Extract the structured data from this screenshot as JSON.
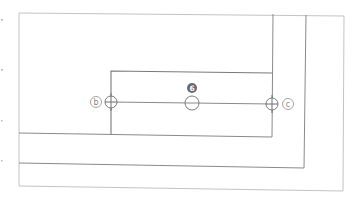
{
  "diagram": {
    "type": "line-drawing",
    "colors": {
      "line": "#8a8a8a",
      "line_light": "#c4c4c4",
      "marker_fill": "#6a6a6a",
      "background": "#ffffff"
    },
    "grid_labels": [
      {
        "id": "b",
        "text": "b",
        "x": 96,
        "y": 103
      },
      {
        "id": "c",
        "text": "c",
        "x": 288,
        "y": 103
      }
    ],
    "numbered_marker": {
      "text": "6",
      "x": 192,
      "y": 88
    },
    "crosshair_markers": [
      {
        "name": "left",
        "x": 111,
        "y": 103
      },
      {
        "name": "center",
        "x": 192,
        "y": 103
      },
      {
        "name": "right",
        "x": 273,
        "y": 103
      }
    ],
    "edge_ticks": [
      {
        "x": 2,
        "y": 20
      },
      {
        "x": 2,
        "y": 70
      },
      {
        "x": 2,
        "y": 120
      },
      {
        "x": 2,
        "y": 160
      }
    ]
  }
}
